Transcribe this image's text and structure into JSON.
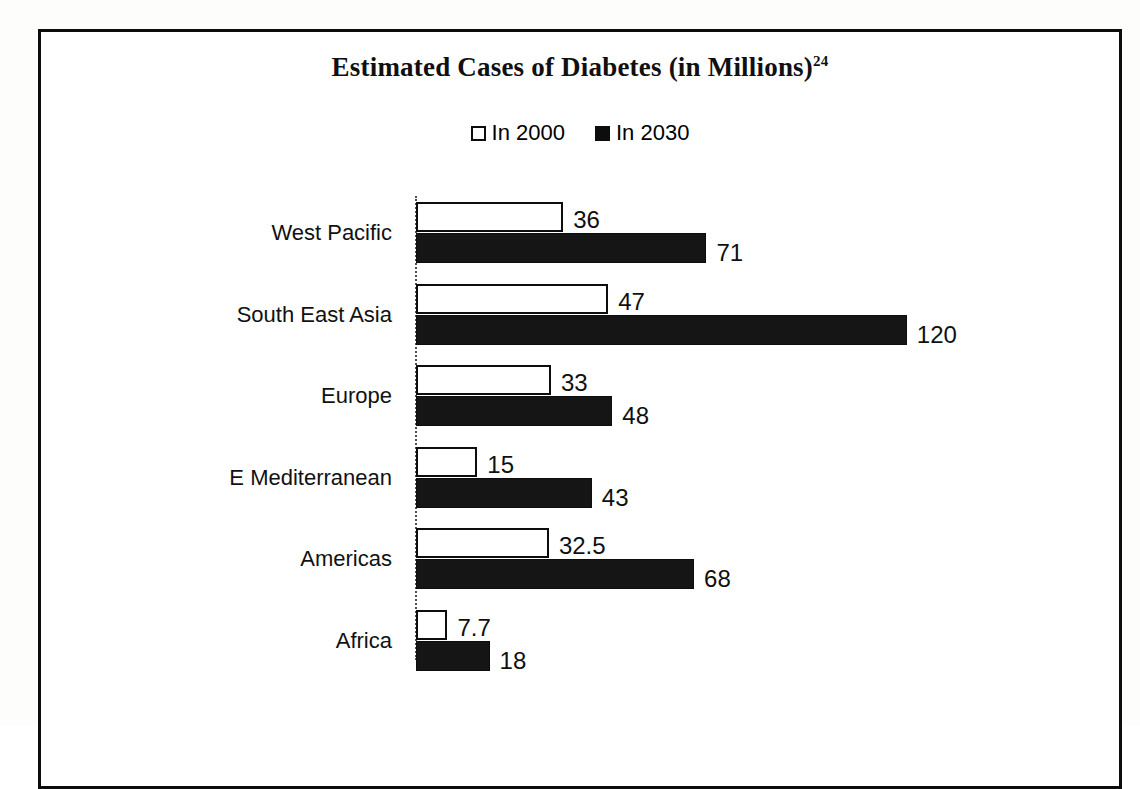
{
  "figure": {
    "title_main": "Estimated Cases of Diabetes (in Millions)",
    "title_superscript": "24",
    "frame_color": "#0d0d0d",
    "background": "#ffffff"
  },
  "legend": {
    "position": "top-center",
    "entries": [
      {
        "label": "In 2000",
        "swatch": "hollow-square",
        "color": "#ffffff"
      },
      {
        "label": "In 2030",
        "swatch": "filled-square",
        "color": "#0d0d0d"
      }
    ]
  },
  "chart_data": {
    "type": "bar",
    "orientation": "horizontal",
    "title": "Estimated Cases of Diabetes (in Millions)",
    "title_superscript": "24",
    "xlabel": "",
    "ylabel": "",
    "grid": false,
    "legend_position": "top-center",
    "xlim": [
      0,
      120
    ],
    "categories": [
      "West Pacific",
      "South East Asia",
      "Europe",
      "E Mediterranean",
      "Americas",
      "Africa"
    ],
    "series": [
      {
        "name": "In 2000",
        "color": "#ffffff",
        "edge_color": "#0d0d0d",
        "values": [
          36,
          47,
          33,
          15,
          32.5,
          7.7
        ],
        "value_labels": [
          "36",
          "47",
          "33",
          "15",
          "32.5",
          "7.7"
        ]
      },
      {
        "name": "In 2030",
        "color": "#151515",
        "edge_color": "#0d0d0d",
        "values": [
          71,
          120,
          48,
          43,
          68,
          18
        ],
        "value_labels": [
          "71",
          "120",
          "48",
          "43",
          "68",
          "18"
        ]
      }
    ]
  }
}
